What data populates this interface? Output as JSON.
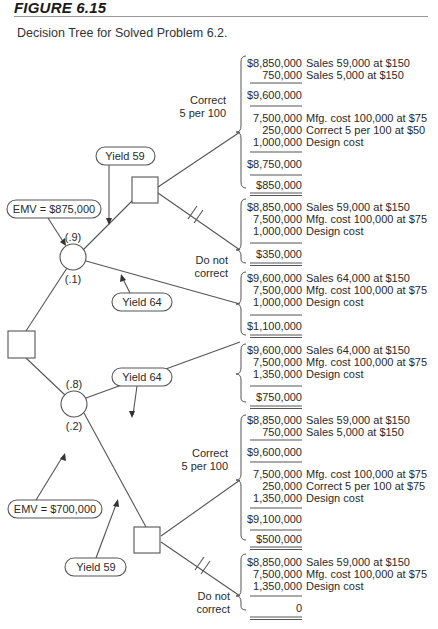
{
  "figure": {
    "title": "FIGURE 6.15",
    "caption": "Decision Tree for Solved Problem 6.2."
  },
  "tree": {
    "top_chance": {
      "emv_label": "EMV = $875,000",
      "prob_upper": "(.9)",
      "prob_lower": "(.1)",
      "yield_upper": "Yield 59",
      "yield_lower": "Yield 64"
    },
    "bottom_chance": {
      "emv_label": "EMV = $700,000",
      "prob_upper": "(.8)",
      "prob_lower": "(.2)",
      "yield_upper": "Yield 64",
      "yield_lower": "Yield 59"
    },
    "branch_labels": {
      "correct_line1": "Correct",
      "correct_line2": "5 per 100",
      "donot_line1": "Do not",
      "donot_line2": "correct"
    }
  },
  "outcomes": [
    {
      "id": "top-yield59-correct",
      "groups": [
        [
          {
            "amount": "$8,850,000",
            "desc": "Sales 59,000 at $150"
          },
          {
            "amount": "750,000",
            "desc": "Sales 5,000 at $150"
          }
        ],
        [
          {
            "amount": "$9,600,000",
            "desc": ""
          }
        ],
        [
          {
            "amount": "7,500,000",
            "desc": "Mfg. cost 100,000 at $75"
          },
          {
            "amount": "250,000",
            "desc": "Correct 5 per 100 at $50"
          },
          {
            "amount": "1,000,000",
            "desc": "Design cost"
          }
        ],
        [
          {
            "amount": "$8,750,000",
            "desc": ""
          }
        ]
      ],
      "result": "$850,000"
    },
    {
      "id": "top-yield59-donot",
      "groups": [
        [
          {
            "amount": "$8,850,000",
            "desc": "Sales 59,000 at $150"
          },
          {
            "amount": "7,500,000",
            "desc": "Mfg. cost 100,000 at $75"
          },
          {
            "amount": "1,000,000",
            "desc": "Design cost"
          }
        ]
      ],
      "result": "$350,000"
    },
    {
      "id": "top-yield64",
      "groups": [
        [
          {
            "amount": "$9,600,000",
            "desc": "Sales 64,000 at $150"
          },
          {
            "amount": "7,500,000",
            "desc": "Mfg. cost 100,000 at $75"
          },
          {
            "amount": "1,000,000",
            "desc": "Design cost"
          }
        ]
      ],
      "result": "$1,100,000"
    },
    {
      "id": "bottom-yield64",
      "groups": [
        [
          {
            "amount": "$9,600,000",
            "desc": "Sales 64,000 at $150"
          },
          {
            "amount": "7,500,000",
            "desc": "Mfg. cost 100,000 at $75"
          },
          {
            "amount": "1,350,000",
            "desc": "Design cost"
          }
        ]
      ],
      "result": "$750,000"
    },
    {
      "id": "bottom-yield59-correct",
      "groups": [
        [
          {
            "amount": "$8,850,000",
            "desc": "Sales 59,000 at $150"
          },
          {
            "amount": "750,000",
            "desc": "Sales 5,000 at $150"
          }
        ],
        [
          {
            "amount": "$9,600,000",
            "desc": ""
          }
        ],
        [
          {
            "amount": "7,500,000",
            "desc": "Mfg. cost 100,000 at $75"
          },
          {
            "amount": "250,000",
            "desc": "Correct 5 per 100 at $75"
          },
          {
            "amount": "1,350,000",
            "desc": "Design cost"
          }
        ],
        [
          {
            "amount": "$9,100,000",
            "desc": ""
          }
        ]
      ],
      "result": "$500,000"
    },
    {
      "id": "bottom-yield59-donot",
      "groups": [
        [
          {
            "amount": "$8,850,000",
            "desc": "Sales 59,000 at $150"
          },
          {
            "amount": "7,500,000",
            "desc": "Mfg. cost 100,000 at $75"
          },
          {
            "amount": "1,350,000",
            "desc": "Design cost"
          }
        ]
      ],
      "result": "0"
    }
  ],
  "colors": {
    "line": "#555555",
    "text": "#2a2a2a",
    "background": "#ffffff"
  }
}
